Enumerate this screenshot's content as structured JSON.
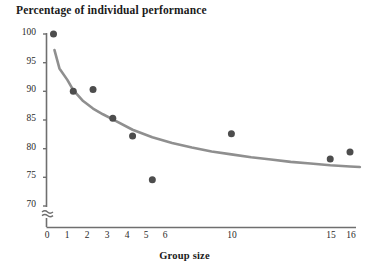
{
  "chart_data": {
    "type": "scatter",
    "title": "Percentage of individual performance",
    "subtitle": "",
    "xlabel": "Group size",
    "ylabel": "",
    "xlim": [
      0,
      16.8
    ],
    "ylim": [
      68.5,
      100.5
    ],
    "y_axis_break": true,
    "y_axis_break_note": "axis broken below 70",
    "grid": false,
    "legend": false,
    "xticks": [
      0,
      1,
      2,
      3,
      4,
      5,
      6,
      10,
      15,
      16
    ],
    "xtick_labels": [
      "0",
      "1",
      "2",
      "3",
      "4",
      "5",
      "6",
      "10",
      "15",
      "16"
    ],
    "yticks": [
      70,
      75,
      80,
      85,
      90,
      95,
      100
    ],
    "ytick_labels": [
      "70",
      "75",
      "80",
      "85",
      "90",
      "95",
      "100"
    ],
    "x": [
      1,
      2,
      3,
      4,
      5,
      6,
      10,
      15,
      16
    ],
    "y": [
      100,
      90,
      90.3,
      85.3,
      82.2,
      74.6,
      82.6,
      78.2,
      79.4
    ],
    "series": [
      {
        "name": "Observed group performance",
        "type": "scatter",
        "marker": "circle",
        "color": "#4d4d4d",
        "points": [
          {
            "x": 1,
            "y": 100
          },
          {
            "x": 2,
            "y": 90
          },
          {
            "x": 3,
            "y": 90.3
          },
          {
            "x": 4,
            "y": 85.3
          },
          {
            "x": 5,
            "y": 82.2
          },
          {
            "x": 6,
            "y": 74.6
          },
          {
            "x": 10,
            "y": 82.6
          },
          {
            "x": 15,
            "y": 78.2
          },
          {
            "x": 16,
            "y": 79.4
          }
        ]
      },
      {
        "name": "Fitted decay curve",
        "type": "line",
        "color": "#8f8f8f",
        "points": [
          {
            "x": 1.05,
            "y": 97.2
          },
          {
            "x": 1.3,
            "y": 94.0
          },
          {
            "x": 1.7,
            "y": 92.0
          },
          {
            "x": 2.0,
            "y": 90.2
          },
          {
            "x": 2.5,
            "y": 88.3
          },
          {
            "x": 3.0,
            "y": 87.0
          },
          {
            "x": 3.5,
            "y": 86.0
          },
          {
            "x": 4.0,
            "y": 85.1
          },
          {
            "x": 5.0,
            "y": 83.3
          },
          {
            "x": 6.0,
            "y": 82.0
          },
          {
            "x": 7.0,
            "y": 81.0
          },
          {
            "x": 8.0,
            "y": 80.2
          },
          {
            "x": 9.0,
            "y": 79.5
          },
          {
            "x": 10.0,
            "y": 79.0
          },
          {
            "x": 11.0,
            "y": 78.5
          },
          {
            "x": 12.0,
            "y": 78.1
          },
          {
            "x": 13.0,
            "y": 77.7
          },
          {
            "x": 14.0,
            "y": 77.4
          },
          {
            "x": 15.0,
            "y": 77.1
          },
          {
            "x": 16.0,
            "y": 76.9
          },
          {
            "x": 16.5,
            "y": 76.8
          }
        ]
      }
    ],
    "colors": {
      "marker": "#4d4d4d",
      "curve": "#8f8f8f",
      "axis": "#6f6f6f",
      "text": "#1a1a1a",
      "background": "#ffffff"
    }
  }
}
